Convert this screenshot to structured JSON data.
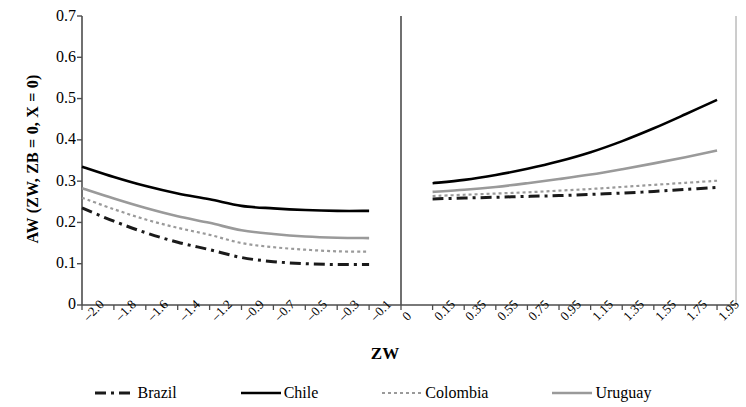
{
  "chart_data": {
    "type": "line",
    "title": "",
    "xlabel": "ZW",
    "ylabel": "AW (ZW, ZB = 0, X = 0)",
    "ylim": [
      0,
      0.7
    ],
    "ytick_labels": [
      "0.7",
      "0.6",
      "0.5",
      "0.4",
      "0.3",
      "0.2",
      "0.1",
      "0"
    ],
    "ytick_values": [
      0.7,
      0.6,
      0.5,
      0.4,
      0.3,
      0.2,
      0.1,
      0
    ],
    "grid": false,
    "legend_position": "bottom",
    "panels": [
      {
        "name": "left-panel",
        "x": [
          -2.0,
          -1.8,
          -1.6,
          -1.4,
          -1.2,
          -0.9,
          -0.7,
          -0.5,
          -0.3,
          -0.1
        ],
        "xtick_labels": [
          "-2.0",
          "-1.8",
          "-1.6",
          "-1.4",
          "-1.2",
          "-0.9",
          "-0.7",
          "-0.5",
          "-0.3",
          "-0.1"
        ],
        "series": [
          {
            "name": "Brazil",
            "values": [
              0.235,
              0.203,
              0.175,
              0.152,
              0.134,
              0.115,
              0.105,
              0.1,
              0.098,
              0.098
            ]
          },
          {
            "name": "Chile",
            "values": [
              0.335,
              0.31,
              0.288,
              0.27,
              0.256,
              0.24,
              0.234,
              0.23,
              0.228,
              0.228
            ]
          },
          {
            "name": "Colombia",
            "values": [
              0.26,
              0.232,
              0.207,
              0.187,
              0.17,
              0.15,
              0.14,
              0.134,
              0.13,
              0.129
            ]
          },
          {
            "name": "Uruguay",
            "values": [
              0.283,
              0.258,
              0.235,
              0.215,
              0.199,
              0.181,
              0.172,
              0.166,
              0.163,
              0.162
            ]
          }
        ]
      },
      {
        "name": "right-panel",
        "x": [
          0,
          0.15,
          0.35,
          0.55,
          0.75,
          0.95,
          1.15,
          1.35,
          1.55,
          1.75,
          1.95
        ],
        "xtick_labels": [
          "0",
          "0.15",
          "0.35",
          "0.55",
          "0.75",
          "0.95",
          "1.15",
          "1.35",
          "1.55",
          "1.75",
          "1.95"
        ],
        "series": [
          {
            "name": "Brazil",
            "values": [
              0.255,
              0.257,
              0.259,
              0.261,
              0.263,
              0.265,
              0.268,
              0.271,
              0.275,
              0.28,
              0.285
            ]
          },
          {
            "name": "Chile",
            "values": [
              0.292,
              0.295,
              0.303,
              0.315,
              0.33,
              0.348,
              0.37,
              0.397,
              0.428,
              0.462,
              0.497
            ]
          },
          {
            "name": "Colombia",
            "values": [
              0.262,
              0.264,
              0.267,
              0.27,
              0.273,
              0.277,
              0.281,
              0.286,
              0.291,
              0.296,
              0.301
            ]
          },
          {
            "name": "Uruguay",
            "values": [
              0.271,
              0.274,
              0.279,
              0.286,
              0.295,
              0.305,
              0.316,
              0.329,
              0.343,
              0.358,
              0.374
            ]
          }
        ]
      }
    ],
    "legend": [
      {
        "label": "Brazil",
        "style": "dash-dot",
        "color": "#1a1a1a"
      },
      {
        "label": "Chile",
        "style": "solid",
        "color": "#000000"
      },
      {
        "label": "Colombia",
        "style": "dotted",
        "color": "#9a9a9a"
      },
      {
        "label": "Uruguay",
        "style": "solid",
        "color": "#9a9a9a"
      }
    ]
  },
  "axis": {
    "ylabel": "AW (ZW, ZB = 0, X = 0)",
    "xlabel": "ZW"
  }
}
